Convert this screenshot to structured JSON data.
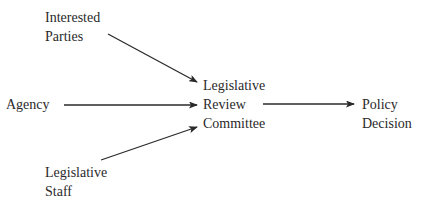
{
  "diagram": {
    "nodes": {
      "interested_parties": {
        "lines": [
          "Interested",
          "Parties"
        ]
      },
      "agency": {
        "lines": [
          "Agency"
        ]
      },
      "legislative_staff": {
        "lines": [
          "Legislative",
          "Staff"
        ]
      },
      "committee": {
        "lines": [
          "Legislative",
          "Review",
          "Committee"
        ]
      },
      "policy_decision": {
        "lines": [
          "Policy",
          "Decision"
        ]
      }
    },
    "edges": [
      {
        "from": "Interested Parties",
        "to": "Legislative Review Committee"
      },
      {
        "from": "Agency",
        "to": "Legislative Review Committee"
      },
      {
        "from": "Legislative Staff",
        "to": "Legislative Review Committee"
      },
      {
        "from": "Legislative Review Committee",
        "to": "Policy Decision"
      }
    ],
    "colors": {
      "line": "#2a2a2a",
      "text": "#2a2a2a",
      "background": "#ffffff"
    }
  }
}
